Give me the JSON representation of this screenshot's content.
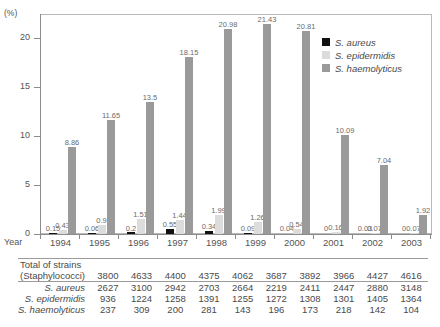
{
  "chart_data": {
    "type": "bar",
    "title": "",
    "ylabel": "(%)",
    "yunit": "(%)",
    "xlabel": "Year",
    "ylim": [
      0,
      22.5
    ],
    "yticks": [
      "0",
      "5",
      "10",
      "15",
      "20"
    ],
    "ytick_values": [
      0,
      5,
      10,
      15,
      20
    ],
    "grid": false,
    "legend_position": "top-right",
    "categories": [
      "1994",
      "1995",
      "1996",
      "1997",
      "1998",
      "1999",
      "2000",
      "2001",
      "2002",
      "2003"
    ],
    "series": [
      {
        "name": "S. aureus",
        "color": "#111111",
        "values": [
          0.15,
          0.06,
          0.2,
          0.55,
          0.34,
          0.09,
          0.04,
          0,
          0.03,
          0
        ],
        "labels": [
          "0.15",
          "0.06",
          "0.2",
          "0.55",
          "0.34",
          "0.09",
          "0.04",
          "0",
          "0.03",
          "0"
        ]
      },
      {
        "name": "S. epidermidis",
        "color": "#dcdcdc",
        "values": [
          0.43,
          0.9,
          1.51,
          1.44,
          1.99,
          1.26,
          0.54,
          0.16,
          0.07,
          0.07
        ],
        "labels": [
          "0.43",
          "0.9",
          "1.51",
          "1.44",
          "1.99",
          "1.26",
          "0.54",
          "0.16",
          "0.07",
          "0.07"
        ]
      },
      {
        "name": "S. haemolyticus",
        "color": "#9a9a9a",
        "values": [
          8.86,
          11.65,
          13.5,
          18.15,
          20.98,
          21.43,
          20.81,
          10.09,
          7.04,
          1.92
        ],
        "labels": [
          "8.86",
          "11.65",
          "13.5",
          "18.15",
          "20.98",
          "21.43",
          "20.81",
          "10.09",
          "7.04",
          "1.92"
        ]
      }
    ]
  },
  "legend": {
    "items": [
      {
        "label": "S. aureus",
        "color": "#111111"
      },
      {
        "label": "S. epidermidis",
        "color": "#dcdcdc"
      },
      {
        "label": "S. haemolyticus",
        "color": "#9a9a9a"
      }
    ]
  },
  "axis": {
    "year_prefix": "Year",
    "unit": "(%)"
  },
  "table": {
    "rows": [
      {
        "label_line1": "Total of strains",
        "label_line2": "(Staphylococci)",
        "italic": false,
        "values": [
          "3800",
          "4633",
          "4400",
          "4375",
          "4062",
          "3687",
          "3892",
          "3966",
          "4427",
          "4616"
        ]
      },
      {
        "label_line1": "S. aureus",
        "label_line2": "",
        "italic": true,
        "values": [
          "2627",
          "3100",
          "2942",
          "2703",
          "2664",
          "2219",
          "2411",
          "2447",
          "2880",
          "3148"
        ]
      },
      {
        "label_line1": "S. epidermidis",
        "label_line2": "",
        "italic": true,
        "values": [
          "936",
          "1224",
          "1258",
          "1391",
          "1255",
          "1272",
          "1308",
          "1301",
          "1405",
          "1364"
        ]
      },
      {
        "label_line1": "S. haemolyticus",
        "label_line2": "",
        "italic": true,
        "values": [
          "237",
          "309",
          "200",
          "281",
          "143",
          "196",
          "173",
          "218",
          "142",
          "104"
        ]
      }
    ]
  }
}
